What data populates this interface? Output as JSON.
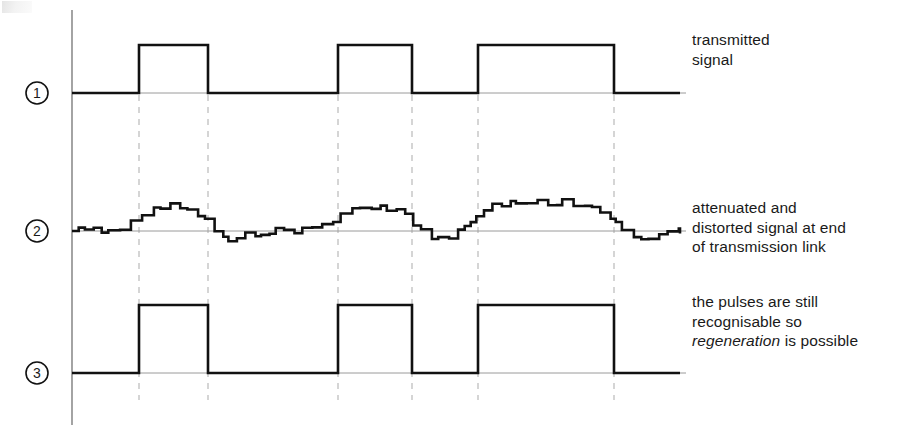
{
  "figure": {
    "title": "",
    "axis": {
      "x": 72,
      "y_top": 10,
      "y_bottom": 425
    },
    "traces": [
      {
        "id": "1",
        "marker": "1",
        "name": "transmitted-signal",
        "kind": "square-wave",
        "baseline_y": 93,
        "high_y": 45,
        "x_start": 72,
        "x_end": 680,
        "pulses": [
          {
            "rise": 139,
            "fall": 208
          },
          {
            "rise": 338,
            "fall": 412
          },
          {
            "rise": 478,
            "fall": 614
          }
        ],
        "label_lines": [
          "transmitted",
          "signal"
        ],
        "label_italic_word": ""
      },
      {
        "id": "2",
        "marker": "2",
        "name": "attenuated-distorted-signal",
        "kind": "noisy-analog",
        "baseline_y": 231,
        "x_start": 72,
        "x_end": 680,
        "bumps": [
          {
            "rise": 139,
            "fall": 208,
            "peak_y": 205
          },
          {
            "rise": 338,
            "fall": 412,
            "peak_y": 207
          },
          {
            "rise": 478,
            "fall": 614,
            "peak_y": 203
          }
        ],
        "label_lines": [
          "attenuated and",
          "distorted signal at end",
          "of transmission link"
        ],
        "label_italic_word": ""
      },
      {
        "id": "3",
        "marker": "3",
        "name": "regenerated-signal",
        "kind": "square-wave",
        "baseline_y": 373,
        "high_y": 305,
        "x_start": 72,
        "x_end": 680,
        "pulses": [
          {
            "rise": 139,
            "fall": 208
          },
          {
            "rise": 338,
            "fall": 412
          },
          {
            "rise": 478,
            "fall": 614
          }
        ],
        "label_lines": [
          "the pulses are still",
          "recognisable so",
          "regeneration is possible"
        ],
        "label_italic_word": "regeneration"
      }
    ],
    "guide_lines_x": [
      139,
      208,
      338,
      412,
      478,
      614
    ],
    "guide_line_top": 95,
    "guide_line_bottom": 400,
    "colors": {
      "stroke": "#111111",
      "axis": "#8d8d8d",
      "guide": "#b9b9b9",
      "reference": "#9a9a9a",
      "text": "#1a1a1a",
      "background": "#ffffff"
    },
    "stroke_width": 2.6,
    "marker_radius": 11
  }
}
